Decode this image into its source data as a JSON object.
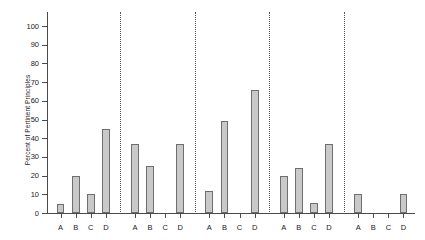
{
  "chart_data": {
    "type": "bar",
    "title": "",
    "xlabel": "",
    "ylabel": "Percent of Pertinent Principles",
    "ylim": [
      0,
      100
    ],
    "ytick_values": [
      0,
      10,
      20,
      30,
      40,
      50,
      60,
      70,
      80,
      90,
      100
    ],
    "ytick_labels": [
      "0",
      "10",
      "20",
      "30",
      "40",
      "50",
      "60",
      "70",
      "80",
      "90",
      "100"
    ],
    "grid": false,
    "legend": false,
    "categories": [
      "A",
      "B",
      "C",
      "D"
    ],
    "group_separators": true,
    "groups": [
      {
        "name": "Group 1",
        "categories": [
          "A",
          "B",
          "C",
          "D"
        ],
        "values": [
          5,
          20,
          10,
          45
        ]
      },
      {
        "name": "Group 2",
        "categories": [
          "A",
          "B",
          "C",
          "D"
        ],
        "values": [
          37,
          25,
          0,
          37
        ]
      },
      {
        "name": "Group 3",
        "categories": [
          "A",
          "B",
          "C",
          "D"
        ],
        "values": [
          12,
          49,
          0,
          66
        ]
      },
      {
        "name": "Group 4",
        "categories": [
          "A",
          "B",
          "C",
          "D"
        ],
        "values": [
          20,
          24,
          5.5,
          37
        ]
      },
      {
        "name": "Group 5",
        "categories": [
          "A",
          "B",
          "C",
          "D"
        ],
        "values": [
          10,
          0,
          0,
          10
        ]
      }
    ],
    "colors": {
      "bar_fill": "#c9c9c9",
      "bar_stroke": "#6e6e6e",
      "axis": "#4a4a4a",
      "separator": "#555555",
      "text": "#1a1a1a",
      "background": "#ffffff"
    }
  }
}
